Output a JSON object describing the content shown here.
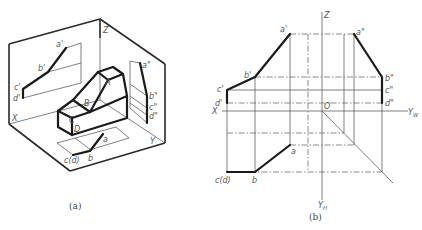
{
  "figure_a": {
    "caption": "(a)",
    "labels": {
      "a_prime": "a'",
      "b_prime": "b'",
      "c_prime": "c'",
      "d_prime": "d'",
      "a_dprime": "a\"",
      "b_dprime": "b\"",
      "c_dprime": "c\"",
      "d_dprime": "d\"",
      "A": "A",
      "B": "B",
      "C": "C",
      "D": "D",
      "a": "a",
      "b": "b",
      "cd": "c(d)",
      "X": "X",
      "Y": "Y",
      "Z": "Z"
    }
  },
  "figure_b": {
    "caption": "(b)",
    "labels": {
      "a_prime": "a'",
      "b_prime": "b'",
      "c_prime": "c'",
      "d_prime": "d'",
      "a_dprime": "a\"",
      "b_dprime": "b\"",
      "c_dprime": "c\"",
      "d_dprime": "d\"",
      "a": "a",
      "b": "b",
      "cd": "c(d)",
      "X": "X",
      "Z": "Z",
      "O": "O",
      "Yw": "Y",
      "Yw_sub": "W",
      "Yh": "Y",
      "Yh_sub": "H"
    }
  },
  "colors": {
    "line": "#1a1a1a",
    "thin": "#4a4a4a",
    "label": "#555555",
    "background": "#ffffff"
  }
}
